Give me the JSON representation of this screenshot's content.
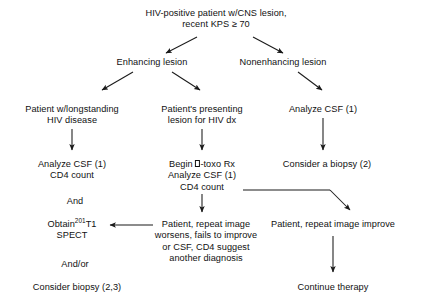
{
  "chart_data": {
    "type": "diagram",
    "diagram_kind": "clinical decision flowchart",
    "nodes": [
      {
        "id": "root",
        "lines": [
          "HIV-positive patient w/CNS lesion,",
          "recent KPS ≥ 70"
        ],
        "x": 216,
        "y": 8
      },
      {
        "id": "enhancing",
        "lines": [
          "Enhancing lesion"
        ],
        "x": 152,
        "y": 57
      },
      {
        "id": "nonenhancing",
        "lines": [
          "Nonenhancing lesion"
        ],
        "x": 283,
        "y": 57
      },
      {
        "id": "longstanding",
        "lines": [
          "Patient w/longstanding",
          "HIV disease"
        ],
        "x": 72,
        "y": 104
      },
      {
        "id": "presenting",
        "lines": [
          "Patient's presenting",
          "lesion for HIV dx"
        ],
        "x": 202,
        "y": 104
      },
      {
        "id": "analyze-csf-right",
        "lines": [
          "Analyze CSF (1)"
        ],
        "x": 323,
        "y": 104
      },
      {
        "id": "analyze-csf-left",
        "lines": [
          "Analyze CSF (1)",
          "CD4 count"
        ],
        "x": 72,
        "y": 159
      },
      {
        "id": "begin-toxo",
        "lines": [
          "Begin □-toxo Rx",
          "Analyze CSF (1)",
          "CD4 count"
        ],
        "x": 202,
        "y": 159
      },
      {
        "id": "consider-biopsy-2",
        "lines": [
          "Consider a biopsy (2)"
        ],
        "x": 327,
        "y": 159
      },
      {
        "id": "and",
        "lines": [
          "And"
        ],
        "x": 75,
        "y": 196
      },
      {
        "id": "obtain-spect",
        "lines": [
          "Obtain<sup>201</sup>T1",
          "SPECT"
        ],
        "x": 72,
        "y": 219,
        "html": true
      },
      {
        "id": "repeat-worsens",
        "lines": [
          "Patient, repeat image",
          "worsens, fails to improve",
          "or CSF, CD4 suggest",
          "another diagnosis"
        ],
        "x": 206,
        "y": 219
      },
      {
        "id": "repeat-improve",
        "lines": [
          "Patient, repeat image improve"
        ],
        "x": 333,
        "y": 219
      },
      {
        "id": "and-or",
        "lines": [
          "And/or"
        ],
        "x": 75,
        "y": 259
      },
      {
        "id": "continue-therapy",
        "lines": [
          "Continue therapy"
        ],
        "x": 333,
        "y": 282
      },
      {
        "id": "consider-biopsy-23",
        "lines": [
          "Consider biopsy (2,3)"
        ],
        "x": 77,
        "y": 282
      }
    ],
    "edges": [
      {
        "id": "root-to-enhancing",
        "from": "root",
        "to": "enhancing",
        "style": "diagonal-arrow"
      },
      {
        "id": "root-to-nonenhancing",
        "from": "root",
        "to": "nonenhancing",
        "style": "diagonal-arrow"
      },
      {
        "id": "enhancing-to-longstanding",
        "from": "enhancing",
        "to": "longstanding",
        "style": "diagonal-arrow"
      },
      {
        "id": "enhancing-to-presenting",
        "from": "enhancing",
        "to": "presenting",
        "style": "diagonal-arrow"
      },
      {
        "id": "nonenhancing-to-analyze-csf-right",
        "from": "nonenhancing",
        "to": "analyze-csf-right",
        "style": "diagonal-arrow"
      },
      {
        "id": "longstanding-to-analyze-csf-left",
        "from": "longstanding",
        "to": "analyze-csf-left",
        "style": "vertical-arrow"
      },
      {
        "id": "presenting-to-begin-toxo",
        "from": "presenting",
        "to": "begin-toxo",
        "style": "vertical-arrow"
      },
      {
        "id": "analyze-csf-right-to-consider-biopsy",
        "from": "analyze-csf-right",
        "to": "consider-biopsy-2",
        "style": "vertical-arrow"
      },
      {
        "id": "begin-toxo-to-repeat-worsens",
        "from": "begin-toxo",
        "to": "repeat-worsens",
        "style": "vertical-arrow"
      },
      {
        "id": "begin-toxo-to-repeat-improve",
        "from": "begin-toxo",
        "to": "repeat-improve",
        "style": "elbow-arrow"
      },
      {
        "id": "repeat-worsens-to-obtain-spect",
        "from": "repeat-worsens",
        "to": "obtain-spect",
        "style": "horizontal-left-arrow"
      },
      {
        "id": "repeat-improve-to-continue-therapy",
        "from": "repeat-improve",
        "to": "continue-therapy",
        "style": "vertical-arrow"
      }
    ],
    "connectors": [
      {
        "name": "root-split-left",
        "type": "arrow",
        "x1": 197,
        "y1": 37,
        "x2": 166,
        "y2": 53
      },
      {
        "name": "root-split-right",
        "type": "arrow",
        "x1": 253,
        "y1": 37,
        "x2": 283,
        "y2": 53
      },
      {
        "name": "enhancing-split-left",
        "type": "arrow",
        "x1": 133,
        "y1": 72,
        "x2": 102,
        "y2": 90
      },
      {
        "name": "enhancing-split-right",
        "type": "arrow",
        "x1": 172,
        "y1": 72,
        "x2": 200,
        "y2": 90
      },
      {
        "name": "nonenhancing-down",
        "type": "arrow",
        "x1": 298,
        "y1": 72,
        "x2": 322,
        "y2": 90
      },
      {
        "name": "longstanding-down",
        "type": "arrow",
        "x1": 72,
        "y1": 129,
        "x2": 72,
        "y2": 150
      },
      {
        "name": "presenting-down",
        "type": "arrow",
        "x1": 202,
        "y1": 129,
        "x2": 202,
        "y2": 150
      },
      {
        "name": "analyze-csf-right-down",
        "type": "arrow",
        "x1": 323,
        "y1": 118,
        "x2": 323,
        "y2": 150
      },
      {
        "name": "begin-toxo-down",
        "type": "arrow",
        "x1": 202,
        "y1": 194,
        "x2": 202,
        "y2": 212
      },
      {
        "name": "elbow-horizontal",
        "type": "line",
        "x1": 243,
        "y1": 190,
        "x2": 330,
        "y2": 190
      },
      {
        "name": "elbow-diagonal",
        "type": "arrow",
        "x1": 330,
        "y1": 190,
        "x2": 350,
        "y2": 210
      },
      {
        "name": "worsens-to-spect",
        "type": "arrow",
        "x1": 153,
        "y1": 225,
        "x2": 110,
        "y2": 225
      },
      {
        "name": "improve-down",
        "type": "arrow",
        "x1": 333,
        "y1": 236,
        "x2": 333,
        "y2": 272
      }
    ],
    "colors": {
      "background": "#ffffff",
      "text": "#111111",
      "line": "#1a1a1a"
    },
    "footnotes_referenced": [
      "(1)",
      "(2)",
      "(3)",
      "(2,3)"
    ]
  }
}
